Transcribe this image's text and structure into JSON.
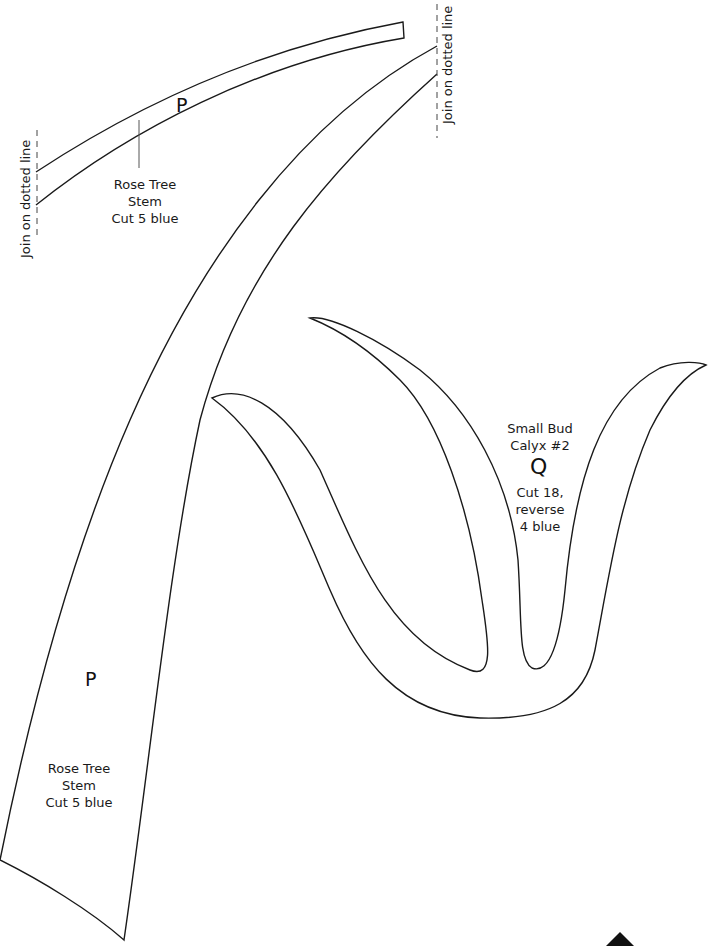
{
  "pieces": [
    {
      "id": "stem-upper",
      "letter": "P",
      "label": [
        "Rose Tree",
        "Stem",
        "Cut 5 blue"
      ]
    },
    {
      "id": "stem-lower",
      "letter": "P",
      "label": [
        "Rose Tree",
        "Stem",
        "Cut 5 blue"
      ]
    },
    {
      "id": "calyx",
      "letter": "Q",
      "label": [
        "Small Bud",
        "Calyx #2",
        "Cut 18,",
        "reverse",
        "4 blue"
      ]
    }
  ],
  "join_marks": [
    {
      "text": "Join on dotted line"
    },
    {
      "text": "Join on dotted line"
    }
  ],
  "colors": {
    "outline": "#1a1a1a",
    "background": "#ffffff"
  }
}
